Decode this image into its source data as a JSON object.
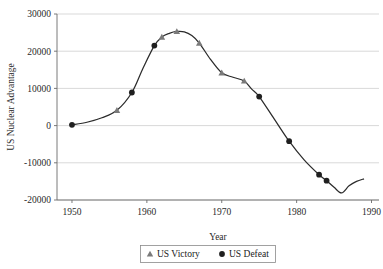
{
  "chart_data": {
    "type": "line",
    "title": "",
    "xlabel": "Year",
    "ylabel": "US Nuclear Advantage",
    "xlim": [
      1948,
      1991
    ],
    "ylim": [
      -20000,
      30000
    ],
    "xticks": [
      1950,
      1960,
      1970,
      1980,
      1990
    ],
    "xtick_labels": [
      "1950",
      "1960",
      "1970",
      "1980",
      "1990"
    ],
    "yticks": [
      -20000,
      -10000,
      0,
      10000,
      20000,
      30000
    ],
    "ytick_labels": [
      "-20000",
      "-10000",
      "0",
      "10000",
      "20000",
      "30000"
    ],
    "grid": "horizontal",
    "legend_position": "bottom-center",
    "line": {
      "x": [
        1950,
        1952,
        1954,
        1956,
        1958,
        1959.5,
        1961,
        1962,
        1963,
        1964,
        1965,
        1966,
        1967,
        1968.5,
        1970,
        1971.5,
        1973,
        1974,
        1975,
        1977,
        1979,
        1981,
        1983,
        1984,
        1985,
        1986,
        1987,
        1988,
        1989
      ],
      "y": [
        200,
        900,
        2100,
        4100,
        8900,
        15500,
        21500,
        23800,
        24800,
        25300,
        25200,
        24200,
        22200,
        17800,
        14200,
        13000,
        12000,
        9800,
        7800,
        1800,
        -4200,
        -9200,
        -13200,
        -14800,
        -16600,
        -18100,
        -16200,
        -15000,
        -14300
      ]
    },
    "series": [
      {
        "name": "US Victory",
        "marker": "triangle",
        "color": "#7a7a7a",
        "points": [
          {
            "x": 1956,
            "y": 4100
          },
          {
            "x": 1962,
            "y": 23800
          },
          {
            "x": 1964,
            "y": 25300
          },
          {
            "x": 1967,
            "y": 22200
          },
          {
            "x": 1970,
            "y": 14200
          },
          {
            "x": 1973,
            "y": 12000
          }
        ]
      },
      {
        "name": "US Defeat",
        "marker": "circle",
        "color": "#1f1f1f",
        "points": [
          {
            "x": 1950,
            "y": 200
          },
          {
            "x": 1958,
            "y": 8900
          },
          {
            "x": 1961,
            "y": 21500
          },
          {
            "x": 1975,
            "y": 7800
          },
          {
            "x": 1979,
            "y": -4200
          },
          {
            "x": 1983,
            "y": -13200
          },
          {
            "x": 1984,
            "y": -14800
          }
        ]
      }
    ],
    "legend": [
      {
        "label": "US Victory",
        "marker": "triangle",
        "color": "#7a7a7a"
      },
      {
        "label": "US Defeat",
        "marker": "circle",
        "color": "#1f1f1f"
      }
    ]
  }
}
